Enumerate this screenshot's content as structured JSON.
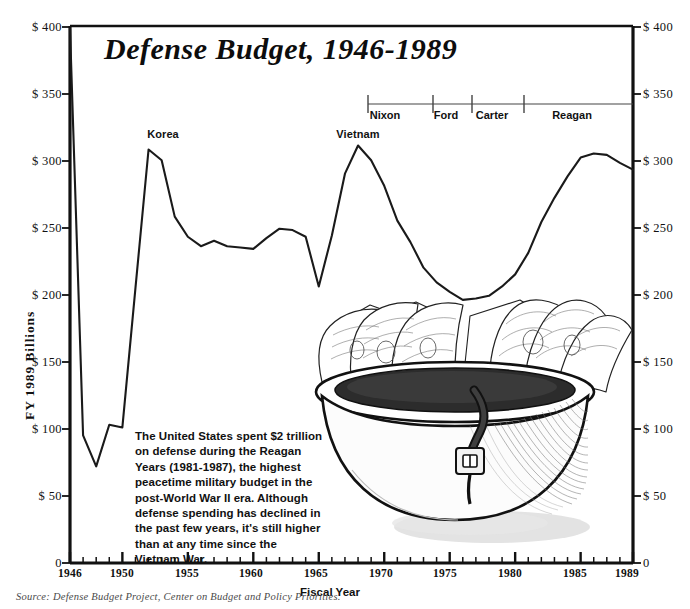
{
  "title": "Defense Budget, 1946-1989",
  "axes": {
    "y_title": "FY 1989 Billions",
    "x_title": "Fiscal Year",
    "y_ticks": [
      "0",
      "$  50",
      "$ 100",
      "$ 150",
      "$ 200",
      "$ 250",
      "$ 300",
      "$ 350",
      "$ 400"
    ],
    "y_ticks_right": [
      "0",
      "$ 50",
      "$ 100",
      "$ 150",
      "$ 200",
      "$ 250",
      "$ 300",
      "$ 350",
      "$ 400"
    ],
    "x_ticks": [
      "1946",
      "1950",
      "1955",
      "1960",
      "1965",
      "1970",
      "1975",
      "1980",
      "1985",
      "1989"
    ]
  },
  "annotations": [
    {
      "label": "Korea",
      "year": 1952
    },
    {
      "label": "Vietnam",
      "year": 1968
    }
  ],
  "presidents": [
    {
      "label": "Nixon",
      "start": 1969,
      "end": 1974
    },
    {
      "label": "Ford",
      "start": 1974,
      "end": 1977
    },
    {
      "label": "Carter",
      "start": 1977,
      "end": 1981
    },
    {
      "label": "Reagan",
      "start": 1981,
      "end": 1989
    }
  ],
  "caption": "The United States spent $2 trillion on defense during the Reagan Years (1981-1987), the highest peacetime military budget in the post-World War II era. Although defense spending has declined in the past few years, it's still higher than at any time since the Vietnam War.",
  "source": "Source: Defense Budget Project, Center on Budget and Policy Priorities.",
  "illustration": "helmet-full-of-money",
  "colors": {
    "ink": "#111111",
    "line": "#1a1a1a",
    "background": "#ffffff",
    "source_text": "#4a4a4a"
  },
  "chart_data": {
    "type": "line",
    "title": "Defense Budget, 1946-1989",
    "xlabel": "Fiscal Year",
    "ylabel": "FY 1989 Billions",
    "xlim": [
      1946,
      1989
    ],
    "ylim": [
      0,
      400
    ],
    "grid": false,
    "legend": "none",
    "x": [
      1946,
      1947,
      1948,
      1949,
      1950,
      1951,
      1952,
      1953,
      1954,
      1955,
      1956,
      1957,
      1958,
      1959,
      1960,
      1961,
      1962,
      1963,
      1964,
      1965,
      1966,
      1967,
      1968,
      1969,
      1970,
      1971,
      1972,
      1973,
      1974,
      1975,
      1976,
      1977,
      1978,
      1979,
      1980,
      1981,
      1982,
      1983,
      1984,
      1985,
      1986,
      1987,
      1988,
      1989
    ],
    "series": [
      {
        "name": "Defense budget (FY1989 $ billions)",
        "values": [
          398,
          95,
          72,
          103,
          101,
          205,
          308,
          300,
          258,
          243,
          236,
          240,
          236,
          235,
          234,
          242,
          249,
          248,
          243,
          206,
          244,
          290,
          311,
          300,
          281,
          255,
          239,
          220,
          209,
          202,
          196,
          197,
          199,
          206,
          215,
          231,
          254,
          272,
          288,
          302,
          305,
          304,
          298,
          293
        ]
      }
    ],
    "annotations": [
      {
        "text": "Korea",
        "x": 1952,
        "y": 308
      },
      {
        "text": "Vietnam",
        "x": 1968,
        "y": 311
      }
    ]
  }
}
